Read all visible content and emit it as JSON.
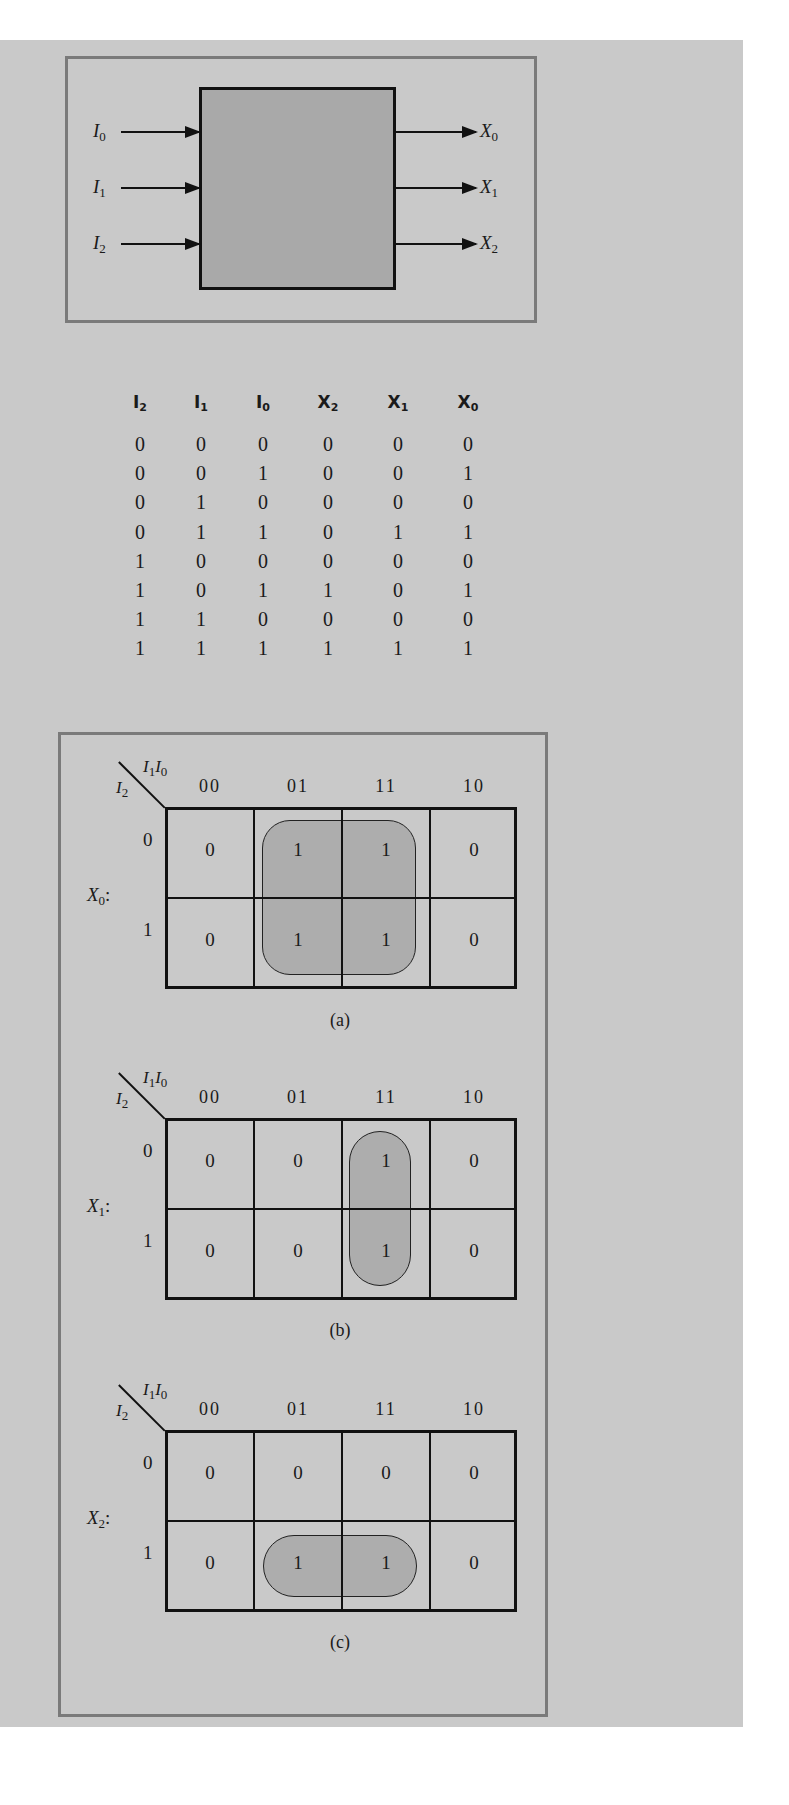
{
  "block_diagram": {
    "inputs": [
      {
        "name": "I",
        "sub": "0"
      },
      {
        "name": "I",
        "sub": "1"
      },
      {
        "name": "I",
        "sub": "2"
      }
    ],
    "outputs": [
      {
        "name": "X",
        "sub": "0"
      },
      {
        "name": "X",
        "sub": "1"
      },
      {
        "name": "X",
        "sub": "2"
      }
    ]
  },
  "truth_table": {
    "headers": [
      {
        "name": "I",
        "sub": "2"
      },
      {
        "name": "I",
        "sub": "1"
      },
      {
        "name": "I",
        "sub": "0"
      },
      {
        "name": "X",
        "sub": "2"
      },
      {
        "name": "X",
        "sub": "1"
      },
      {
        "name": "X",
        "sub": "0"
      }
    ],
    "rows": [
      [
        "0",
        "0",
        "0",
        "0",
        "0",
        "0"
      ],
      [
        "0",
        "0",
        "1",
        "0",
        "0",
        "1"
      ],
      [
        "0",
        "1",
        "0",
        "0",
        "0",
        "0"
      ],
      [
        "0",
        "1",
        "1",
        "0",
        "1",
        "1"
      ],
      [
        "1",
        "0",
        "0",
        "0",
        "0",
        "0"
      ],
      [
        "1",
        "0",
        "1",
        "1",
        "0",
        "1"
      ],
      [
        "1",
        "1",
        "0",
        "0",
        "0",
        "0"
      ],
      [
        "1",
        "1",
        "1",
        "1",
        "1",
        "1"
      ]
    ]
  },
  "kmaps": [
    {
      "output": {
        "name": "X",
        "sub": "0",
        "suffix": ":"
      },
      "col_var": {
        "a": "I",
        "a_sub": "1",
        "b": "I",
        "b_sub": "0"
      },
      "row_var": {
        "name": "I",
        "sub": "2"
      },
      "col_labels": [
        "00",
        "01",
        "11",
        "10"
      ],
      "row_labels": [
        "0",
        "1"
      ],
      "cells": [
        [
          "0",
          "1",
          "1",
          "0"
        ],
        [
          "0",
          "1",
          "1",
          "0"
        ]
      ],
      "caption": "(a)"
    },
    {
      "output": {
        "name": "X",
        "sub": "1",
        "suffix": ":"
      },
      "col_var": {
        "a": "I",
        "a_sub": "1",
        "b": "I",
        "b_sub": "0"
      },
      "row_var": {
        "name": "I",
        "sub": "2"
      },
      "col_labels": [
        "00",
        "01",
        "11",
        "10"
      ],
      "row_labels": [
        "0",
        "1"
      ],
      "cells": [
        [
          "0",
          "0",
          "1",
          "0"
        ],
        [
          "0",
          "0",
          "1",
          "0"
        ]
      ],
      "caption": "(b)"
    },
    {
      "output": {
        "name": "X",
        "sub": "2",
        "suffix": ":"
      },
      "col_var": {
        "a": "I",
        "a_sub": "1",
        "b": "I",
        "b_sub": "0"
      },
      "row_var": {
        "name": "I",
        "sub": "2"
      },
      "col_labels": [
        "00",
        "01",
        "11",
        "10"
      ],
      "row_labels": [
        "0",
        "1"
      ],
      "cells": [
        [
          "0",
          "0",
          "0",
          "0"
        ],
        [
          "0",
          "1",
          "1",
          "0"
        ]
      ],
      "caption": "(c)"
    }
  ],
  "colors": {
    "background": "#c9c9c9",
    "frame": "#7a7a7a",
    "block_fill": "#a9a9a9",
    "loop_fill": "#9e9e9e"
  }
}
